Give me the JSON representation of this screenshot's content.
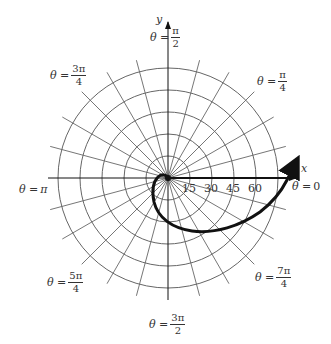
{
  "diagram": {
    "type": "polar-graph",
    "axes": {
      "x_label": "x",
      "y_label": "y"
    },
    "radial_ticks": [
      "15",
      "30",
      "45",
      "60"
    ],
    "rings": 5,
    "ring_step": 15,
    "spokes_every_degrees": 15,
    "angle_labels": [
      {
        "id": "pi-over-2",
        "prefix": "θ =",
        "num": "π",
        "den": "2"
      },
      {
        "id": "3pi-over-4",
        "prefix": "θ =",
        "num": "3π",
        "den": "4"
      },
      {
        "id": "pi-over-4",
        "prefix": "θ =",
        "num": "π",
        "den": "4"
      },
      {
        "id": "pi",
        "prefix": "θ =",
        "value": "π"
      },
      {
        "id": "zero",
        "prefix": "θ =",
        "value": "0"
      },
      {
        "id": "5pi-over-4",
        "prefix": "θ =",
        "num": "5π",
        "den": "4"
      },
      {
        "id": "7pi-over-4",
        "prefix": "θ =",
        "num": "7π",
        "den": "4"
      },
      {
        "id": "3pi-over-2",
        "prefix": "θ =",
        "num": "3π",
        "den": "2"
      }
    ],
    "curve": {
      "description": "spiral from origin, counterclockwise, exiting past θ = 0 with arrow",
      "color": "#111111"
    },
    "colors": {
      "grid": "#555555",
      "axis": "#111111",
      "curve": "#111111",
      "background": "#ffffff"
    }
  }
}
